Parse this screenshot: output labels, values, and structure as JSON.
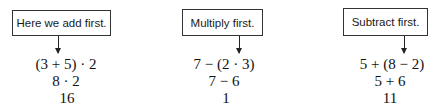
{
  "examples": [
    {
      "callout": "Here we add first.",
      "steps": [
        "(3 + 5) · 2",
        "8 · 2",
        "16"
      ]
    },
    {
      "callout": "Multiply first.",
      "steps": [
        "7 − (2 · 3)",
        "7 − 6",
        "1"
      ]
    },
    {
      "callout": "Subtract first.",
      "steps": [
        "5 + (8 − 2)",
        "5 + 6",
        "11"
      ]
    }
  ]
}
